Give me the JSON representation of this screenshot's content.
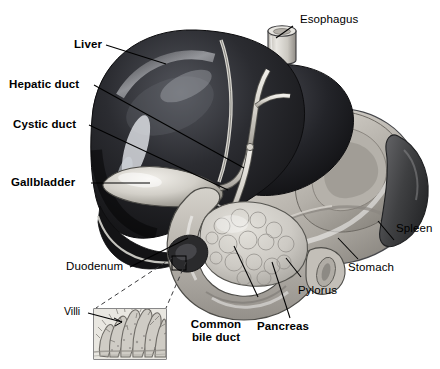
{
  "figure": {
    "kind": "anatomical-illustration",
    "style": "grayscale airbrushed medical illustration on white background",
    "background_color": "#ffffff",
    "line_color": "#000000"
  },
  "labels": {
    "esophagus": "Esophagus",
    "liver": "Liver",
    "hepatic_duct": "Hepatic duct",
    "cystic_duct": "Cystic duct",
    "gallbladder": "Gallbladder",
    "duodenum": "Duodenum",
    "villi": "Villi",
    "common_bile_duct_line1": "Common",
    "common_bile_duct_line2": "bile duct",
    "pancreas": "Pancreas",
    "pylorus": "Pylorus",
    "stomach": "Stomach",
    "spleen": "Spleen"
  },
  "label_style": {
    "bold": [
      "Liver",
      "Hepatic duct",
      "Cystic duct",
      "Gallbladder",
      "Common bile duct",
      "Pancreas"
    ],
    "regular": [
      "Esophagus",
      "Duodenum",
      "Villi",
      "Pylorus",
      "Stomach",
      "Spleen"
    ]
  },
  "palette": {
    "liver_dark": "#1d1d1f",
    "liver_mid": "#33343a",
    "liver_highlight": "#c9cbd0",
    "stomach_light": "#c9c6c0",
    "stomach_mid": "#a9a59e",
    "stomach_shadow": "#7e7a73",
    "spleen_dark": "#4a4a4c",
    "duodenum": "#b8b5ae",
    "pancreas": "#cfcdc7",
    "duct_pale": "#dedbd4",
    "inset_fill": "#e6e4de",
    "white": "#ffffff"
  }
}
